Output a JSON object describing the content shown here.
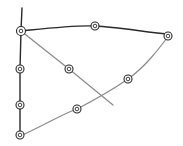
{
  "diagram": {
    "style": "hand-drawn pencil sketch",
    "background": "#ffffff",
    "colors": {
      "dark_stroke": "#2a2a2a",
      "light_stroke": "#8a8a8a"
    },
    "nodes": [
      {
        "id": "n1",
        "x": 21,
        "y": 31
      },
      {
        "id": "n2",
        "x": 95,
        "y": 26
      },
      {
        "id": "n3",
        "x": 168,
        "y": 36
      },
      {
        "id": "n4",
        "x": 20,
        "y": 69
      },
      {
        "id": "n5",
        "x": 20,
        "y": 105
      },
      {
        "id": "n6",
        "x": 20,
        "y": 135
      },
      {
        "id": "n7",
        "x": 69,
        "y": 69
      },
      {
        "id": "n8",
        "x": 128,
        "y": 79
      },
      {
        "id": "n9",
        "x": 77,
        "y": 109
      }
    ],
    "edges": [
      {
        "id": "vertical-axis",
        "tone": "dark",
        "path": "M22 8 L21 31 L20 69 L20 105 L20 136"
      },
      {
        "id": "top-curve",
        "tone": "dark",
        "path": "M21 31 C50 28 75 25 95 26 C120 27 150 33 170 34"
      },
      {
        "id": "diagonal",
        "tone": "light",
        "path": "M21 31 L69 69 L113 105"
      },
      {
        "id": "lower-curve",
        "tone": "light",
        "path": "M20 136 C45 125 60 115 77 109 C100 97 115 88 128 79 C145 67 158 50 170 34"
      }
    ]
  }
}
